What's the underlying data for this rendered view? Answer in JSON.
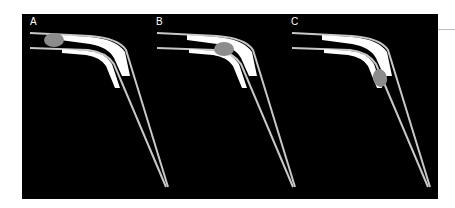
{
  "figure": {
    "panels": [
      {
        "label": "A",
        "object_position": "entrance of tube, near proximal end"
      },
      {
        "label": "B",
        "object_position": "mid-section, before the bend"
      },
      {
        "label": "C",
        "object_position": "at the bend, entering the distal limb"
      }
    ]
  },
  "colors": {
    "background": "#000000",
    "outline": "#c8c8c8",
    "highlight_band": "#ffffff",
    "object": "#8c8c8c",
    "label": "#ffffff"
  }
}
